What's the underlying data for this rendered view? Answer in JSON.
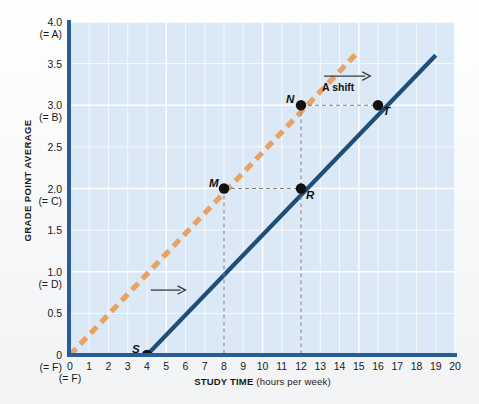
{
  "chart_data": {
    "type": "line",
    "title": "",
    "xlabel_bold": "STUDY TIME",
    "xlabel_rest": " (hours per week)",
    "ylabel": "GRADE POINT AVERAGE",
    "xlim": [
      0,
      20
    ],
    "ylim": [
      0,
      4.0
    ],
    "grid": true,
    "legend_position": "none",
    "xticks": [
      "0",
      "1",
      "2",
      "3",
      "4",
      "5",
      "6",
      "7",
      "8",
      "9",
      "10",
      "11",
      "12",
      "13",
      "14",
      "15",
      "16",
      "17",
      "18",
      "19",
      "20"
    ],
    "xtick_sub": {
      "0": "(= F)"
    },
    "yticks": [
      {
        "value": "4.0",
        "sub": "(= A)"
      },
      {
        "value": "3.5",
        "sub": ""
      },
      {
        "value": "3.0",
        "sub": "(= B)"
      },
      {
        "value": "2.5",
        "sub": ""
      },
      {
        "value": "2.0",
        "sub": "(= C)"
      },
      {
        "value": "1.5",
        "sub": ""
      },
      {
        "value": "1.0",
        "sub": "(= D)"
      },
      {
        "value": "0.5",
        "sub": ""
      },
      {
        "value": "0",
        "sub": "(= F)"
      }
    ],
    "series": [
      {
        "name": "original-line",
        "style": "dashed",
        "color": "#e8a263",
        "x": [
          0,
          15
        ],
        "y": [
          0,
          3.65
        ],
        "slope": 0.25,
        "intercept": 0
      },
      {
        "name": "shifted-line",
        "style": "solid",
        "color": "#1f4e79",
        "x": [
          4,
          19
        ],
        "y": [
          0,
          3.6
        ],
        "slope": 0.24,
        "intercept": -0.96
      }
    ],
    "points": [
      {
        "label": "S",
        "x": 4,
        "y": 0.0,
        "on": "shifted-line",
        "label_pos": "left"
      },
      {
        "label": "M",
        "x": 8,
        "y": 2.0,
        "on": "original-line",
        "label_pos": "left"
      },
      {
        "label": "R",
        "x": 12,
        "y": 2.0,
        "on": "shifted-line",
        "label_pos": "below-right"
      },
      {
        "label": "N",
        "x": 12,
        "y": 3.0,
        "on": "original-line",
        "label_pos": "left"
      },
      {
        "label": "T",
        "x": 16,
        "y": 3.0,
        "on": "shifted-line",
        "label_pos": "below-right"
      }
    ],
    "annotations": [
      {
        "name": "shift-arrow-upper",
        "label": "A shift",
        "x_from": 13.2,
        "x_to": 15.6,
        "y": 3.35
      },
      {
        "name": "shift-arrow-lower",
        "label": "",
        "x_from": 4.2,
        "x_to": 6.0,
        "y": 0.78
      }
    ],
    "guide_lines": [
      {
        "from": [
          8,
          2.0
        ],
        "to": [
          12,
          2.0
        ]
      },
      {
        "from": [
          12,
          3.0
        ],
        "to": [
          16,
          3.0
        ]
      },
      {
        "from": [
          8,
          2.0
        ],
        "to": [
          8,
          0
        ]
      },
      {
        "from": [
          12,
          3.0
        ],
        "to": [
          12,
          0
        ]
      }
    ],
    "colors": {
      "plot_background": "#dbe9f6",
      "grid": "#ffffff",
      "axis": "#2a5d96",
      "series_original": "#e8a263",
      "series_shifted": "#1f4e79",
      "point_marker": "#111111",
      "guide_line": "#7f7f7f"
    }
  }
}
